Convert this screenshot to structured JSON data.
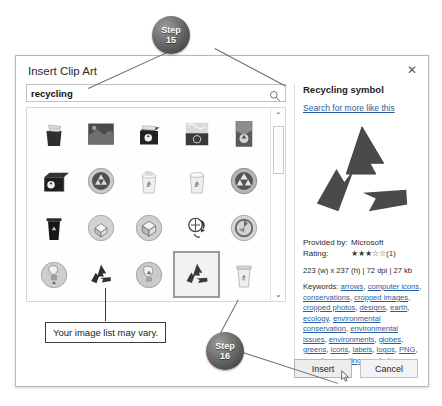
{
  "annotations": {
    "step15": {
      "line1": "Step",
      "line2": "15"
    },
    "step16": {
      "line1": "Step",
      "line2": "16"
    },
    "note": "Your image list may vary."
  },
  "dialog": {
    "title": "Insert Clip Art",
    "close_label": "✕",
    "search": {
      "value": "recycling",
      "placeholder": "Search for clip art",
      "icon": "search-icon"
    },
    "scrollbar": {
      "up": "⌃",
      "down": "⌄"
    },
    "thumbnails": [
      {
        "id": 1,
        "alt": "paper-overflowing-bin",
        "selected": false
      },
      {
        "id": 2,
        "alt": "recycling-photo-dark",
        "selected": false
      },
      {
        "id": 3,
        "alt": "black-recycle-crate",
        "selected": false
      },
      {
        "id": 4,
        "alt": "recycling-photo-stack",
        "selected": false
      },
      {
        "id": 5,
        "alt": "recycling-photo-tall",
        "selected": false
      },
      {
        "id": 6,
        "alt": "black-recycle-box",
        "selected": false
      },
      {
        "id": 7,
        "alt": "recycle-button-sphere",
        "selected": false
      },
      {
        "id": 8,
        "alt": "white-recycle-bin-paper",
        "selected": false
      },
      {
        "id": 9,
        "alt": "white-recycle-bin",
        "selected": false
      },
      {
        "id": 10,
        "alt": "recycle-wheel-badge",
        "selected": false
      },
      {
        "id": 11,
        "alt": "black-wheelie-bin",
        "selected": false
      },
      {
        "id": 12,
        "alt": "open-box-recycle-badge",
        "selected": false
      },
      {
        "id": 13,
        "alt": "cube-recycle-badge",
        "selected": false
      },
      {
        "id": 14,
        "alt": "globe-arrow-recycle",
        "selected": false
      },
      {
        "id": 15,
        "alt": "swirl-recycle-badge",
        "selected": false
      },
      {
        "id": 16,
        "alt": "lightbulb-recycle-badge",
        "selected": false
      },
      {
        "id": 17,
        "alt": "three-arrow-loop",
        "selected": false
      },
      {
        "id": 18,
        "alt": "bulb-circle-recycle-badge",
        "selected": false
      },
      {
        "id": 19,
        "alt": "recycling-symbol",
        "selected": true
      },
      {
        "id": 20,
        "alt": "trash-can-recycle",
        "selected": false
      }
    ],
    "preview": {
      "title": "Recycling symbol",
      "more_link": "Search for more like this",
      "provided_by_label": "Provided by:",
      "provided_by_value": "Microsoft",
      "rating_label": "Rating:",
      "rating_filled": 3,
      "rating_total": 5,
      "rating_count": "(1)",
      "dimensions": "223 (w) x 237 (h) | 72 dpi | 27 kb",
      "keywords_label": "Keywords:",
      "keywords": [
        "arrows",
        "computer icons",
        "conservations",
        "cropped images",
        "cropped photos",
        "designs",
        "earth",
        "ecology",
        "environmental conservation",
        "environmental issues",
        "environments",
        "globes",
        "greens",
        "icons",
        "labels",
        "logos",
        "PNG",
        "recycle",
        "recycling",
        "symbols"
      ]
    },
    "buttons": {
      "insert": "Insert",
      "cancel": "Cancel"
    }
  }
}
